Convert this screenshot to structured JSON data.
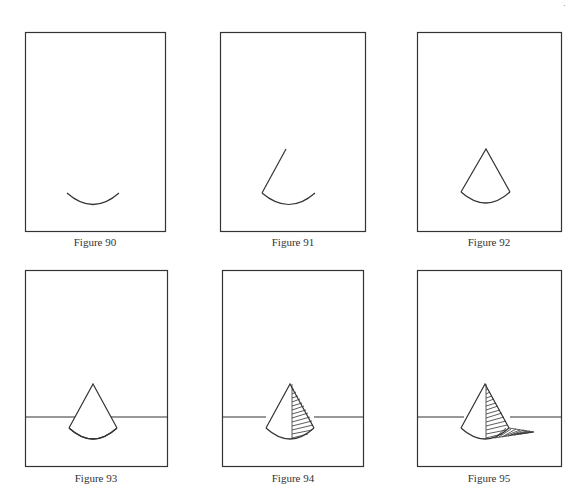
{
  "page": {
    "page_number_fragment": "·"
  },
  "figures": [
    {
      "id": "fig90",
      "caption": "Figure 90",
      "stage": "base arc of cone"
    },
    {
      "id": "fig91",
      "caption": "Figure 91",
      "stage": "base arc plus left side line"
    },
    {
      "id": "fig92",
      "caption": "Figure 92",
      "stage": "complete cone outline"
    },
    {
      "id": "fig93",
      "caption": "Figure 93",
      "stage": "cone with horizon line"
    },
    {
      "id": "fig94",
      "caption": "Figure 94",
      "stage": "cone with shaded right side"
    },
    {
      "id": "fig95",
      "caption": "Figure 95",
      "stage": "cone with shading and cast shadow"
    }
  ],
  "colors": {
    "line": "#333333",
    "background": "#ffffff"
  }
}
